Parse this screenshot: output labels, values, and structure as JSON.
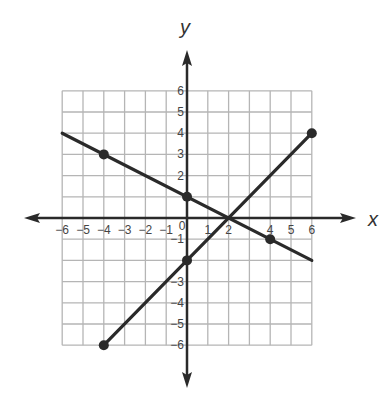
{
  "chart_data": {
    "type": "line",
    "title": "",
    "xlabel": "x",
    "ylabel": "y",
    "xlim": [
      -6,
      6
    ],
    "ylim": [
      -6,
      6
    ],
    "grid": true,
    "x_ticks": [
      -6,
      -5,
      -4,
      -3,
      -2,
      -1,
      0,
      1,
      2,
      4,
      5,
      6
    ],
    "y_ticks": [
      6,
      5,
      4,
      3,
      2,
      -1,
      -3,
      -4,
      -5,
      -6
    ],
    "series": [
      {
        "name": "line-1",
        "equation": "y = -x/2 + 1",
        "start": [
          -6,
          4
        ],
        "end": [
          6,
          -2
        ],
        "points": [
          [
            -4,
            3
          ],
          [
            0,
            1
          ],
          [
            4,
            -1
          ]
        ]
      },
      {
        "name": "line-2",
        "equation": "y = x - 2",
        "start": [
          -4,
          -6
        ],
        "end": [
          6,
          4
        ],
        "points": [
          [
            -4,
            -6
          ],
          [
            0,
            -2
          ],
          [
            6,
            4
          ]
        ]
      }
    ],
    "intersection": [
      2,
      0
    ]
  },
  "colors": {
    "grid": "#b5b5b5",
    "axis": "#2a2a2a",
    "line": "#2a2a2a",
    "text": "#444444"
  }
}
